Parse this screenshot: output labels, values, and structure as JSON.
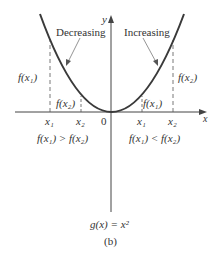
{
  "figure": {
    "function_label": "g(x) = x²",
    "subfigure_label": "(b)",
    "axis_labels": {
      "x": "x",
      "y": "y"
    },
    "origin_label": "0",
    "left_region": {
      "label": "Decreasing",
      "x1": "x₁",
      "x2": "x₂",
      "f_x1": "f(x₁)",
      "f_x2": "f(x₂)",
      "relation": "f(x₁) > f(x₂)"
    },
    "right_region": {
      "label": "Increasing",
      "x1": "x₁",
      "x2": "x₂",
      "f_x1": "f(x₁)",
      "f_x2": "f(x₂)",
      "relation": "f(x₁) < f(x₂)"
    },
    "colors": {
      "curve": "#3a3a3a",
      "axes": "#444444",
      "text": "#333333"
    }
  }
}
